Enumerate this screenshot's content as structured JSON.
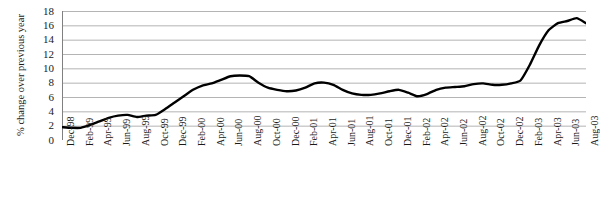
{
  "chart_data": {
    "type": "line",
    "title": "",
    "subtitle": "",
    "xlabel": "",
    "ylabel": "% change over previous year",
    "ylim": [
      0,
      18
    ],
    "ytick_step": 2,
    "ytick_labels": [
      "18",
      "16",
      "14",
      "12",
      "10",
      "8",
      "6",
      "4",
      "2",
      "0"
    ],
    "grid": "horizontal",
    "legend": "none",
    "line_color": "#000000",
    "grid_color": "#b4b4b4",
    "axis_color": "#808080",
    "background": "#ffffff",
    "x_tick_labels": [
      "Dec-98",
      "Feb-99",
      "Apr-99",
      "Jun-99",
      "Aug-99",
      "Oct-99",
      "Dec-99",
      "Feb-00",
      "Apr-00",
      "Jun-00",
      "Aug-00",
      "Oct-00",
      "Dec-00",
      "Feb-01",
      "Apr-01",
      "Jun-01",
      "Aug-01",
      "Oct-01",
      "Dec-01",
      "Feb-02",
      "Apr-02",
      "Jun-02",
      "Aug-02",
      "Oct-02",
      "Dec-02",
      "Feb-03",
      "Apr-03",
      "Jun-03",
      "Aug-03"
    ],
    "x": [
      "Dec-98",
      "Jan-99",
      "Feb-99",
      "Mar-99",
      "Apr-99",
      "May-99",
      "Jun-99",
      "Jul-99",
      "Aug-99",
      "Sep-99",
      "Oct-99",
      "Nov-99",
      "Dec-99",
      "Jan-00",
      "Feb-00",
      "Mar-00",
      "Apr-00",
      "May-00",
      "Jun-00",
      "Jul-00",
      "Aug-00",
      "Sep-00",
      "Oct-00",
      "Nov-00",
      "Dec-00",
      "Jan-01",
      "Feb-01",
      "Mar-01",
      "Apr-01",
      "May-01",
      "Jun-01",
      "Jul-01",
      "Aug-01",
      "Sep-01",
      "Oct-01",
      "Nov-01",
      "Dec-01",
      "Jan-02",
      "Feb-02",
      "Mar-02",
      "Apr-02",
      "May-02",
      "Jun-02",
      "Jul-02",
      "Aug-02",
      "Sep-02",
      "Oct-02",
      "Nov-02",
      "Dec-02",
      "Jan-03",
      "Feb-03",
      "Mar-03",
      "Apr-03",
      "May-03",
      "Jun-03",
      "Jul-03",
      "Aug-03"
    ],
    "values": [
      1.8,
      1.7,
      1.7,
      2.1,
      2.6,
      3.1,
      3.4,
      3.5,
      3.2,
      3.4,
      3.5,
      4.3,
      5.2,
      6.1,
      7.0,
      7.6,
      7.9,
      8.4,
      8.9,
      9.0,
      8.9,
      8.0,
      7.3,
      7.0,
      6.8,
      6.9,
      7.3,
      7.9,
      8.0,
      7.7,
      7.0,
      6.5,
      6.3,
      6.3,
      6.5,
      6.8,
      7.0,
      6.6,
      6.1,
      6.4,
      7.0,
      7.3,
      7.4,
      7.5,
      7.8,
      7.9,
      7.7,
      7.7,
      7.9,
      8.3,
      10.5,
      13.2,
      15.3,
      16.3,
      16.6,
      17.0,
      16.3
    ]
  }
}
